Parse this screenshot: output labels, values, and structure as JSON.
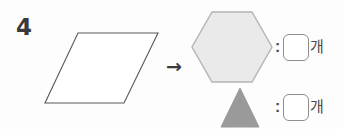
{
  "problem": {
    "number": "4",
    "arrow": "→"
  },
  "source_shape": {
    "name": "parallelogram",
    "fill": "#ffffff",
    "stroke": "#585858",
    "points": "78,33 158,33 124,103 45,103"
  },
  "target_shapes": [
    {
      "name": "hexagon",
      "fill": "#eaeaea",
      "stroke": "#b4b4b4",
      "points": "212,12 252,12 272,47 252,82 212,82 192,47"
    },
    {
      "name": "triangle",
      "fill": "#9a9a9a",
      "stroke": "#9a9a9a",
      "points": "240,88 259,127 221,127"
    }
  ],
  "answers": [
    {
      "shape": "hexagon",
      "colon": ":",
      "value": "",
      "placeholder": "",
      "unit": "개"
    },
    {
      "shape": "triangle",
      "colon": ":",
      "value": "",
      "placeholder": "",
      "unit": "개"
    }
  ]
}
